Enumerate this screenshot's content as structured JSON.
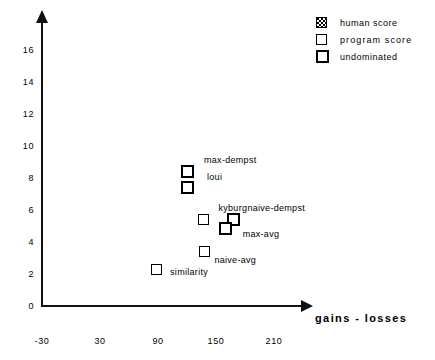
{
  "chart_data": {
    "type": "scatter",
    "title": "",
    "xlabel": "gains  -  losses",
    "ylabel": "",
    "xlim": [
      -30,
      225
    ],
    "ylim": [
      0,
      17.5
    ],
    "xticks": [
      "-30",
      "30",
      "90",
      "150",
      "210"
    ],
    "xtick_values": [
      -30,
      30,
      90,
      150,
      210
    ],
    "yticks": [
      "0",
      "2",
      "4",
      "6",
      "8",
      "10",
      "12",
      "14",
      "16"
    ],
    "ytick_values": [
      0,
      2,
      4,
      6,
      8,
      10,
      12,
      14,
      16
    ],
    "grid": false,
    "legend_position": "top-right",
    "legend": [
      {
        "label": "human score",
        "marker": "hatched-square",
        "key": "human"
      },
      {
        "label": "program  score",
        "marker": "thin-square",
        "key": "program"
      },
      {
        "label": "undominated",
        "marker": "thick-square",
        "key": "undominated"
      }
    ],
    "points": [
      {
        "label": "max-dempst",
        "x": 120,
        "y": 8.4,
        "marker": "undominated",
        "label_dx": 17,
        "label_dy": -12
      },
      {
        "label": "loui",
        "x": 120,
        "y": 7.4,
        "marker": "undominated",
        "label_dx": 20,
        "label_dy": -11
      },
      {
        "label": "kyburg",
        "x": 137,
        "y": 5.4,
        "marker": "program",
        "label_dx": 15,
        "label_dy": -12
      },
      {
        "label": "naive-dempst",
        "x": 168,
        "y": 5.4,
        "marker": "undominated",
        "label_dx": 14,
        "label_dy": -12
      },
      {
        "label": "max-avg",
        "x": 160,
        "y": 4.85,
        "marker": "undominated",
        "label_dx": 17,
        "label_dy": 6
      },
      {
        "label": "naive-avg",
        "x": 138,
        "y": 3.4,
        "marker": "program",
        "label_dx": 10,
        "label_dy": 8
      },
      {
        "label": "similarity",
        "x": 88,
        "y": 2.3,
        "marker": "program",
        "label_dx": 14,
        "label_dy": 3
      }
    ],
    "axis_arrows": {
      "x": true,
      "y": true
    },
    "colors": {
      "foreground": "#000000",
      "background": "#ffffff"
    }
  }
}
